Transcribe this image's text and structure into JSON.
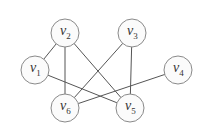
{
  "graph": {
    "nodes": [
      {
        "id": "v1",
        "base": "v",
        "sub": "1",
        "x": 35,
        "y": 70
      },
      {
        "id": "v2",
        "base": "v",
        "sub": "2",
        "x": 65,
        "y": 33
      },
      {
        "id": "v3",
        "base": "v",
        "sub": "3",
        "x": 132,
        "y": 33
      },
      {
        "id": "v4",
        "base": "v",
        "sub": "4",
        "x": 178,
        "y": 70
      },
      {
        "id": "v5",
        "base": "v",
        "sub": "5",
        "x": 130,
        "y": 108
      },
      {
        "id": "v6",
        "base": "v",
        "sub": "6",
        "x": 65,
        "y": 108
      }
    ],
    "edges": [
      [
        "v1",
        "v2"
      ],
      [
        "v2",
        "v6"
      ],
      [
        "v2",
        "v5"
      ],
      [
        "v1",
        "v5"
      ],
      [
        "v3",
        "v6"
      ],
      [
        "v3",
        "v5"
      ],
      [
        "v4",
        "v6"
      ]
    ],
    "node_radius": 14,
    "colors": {
      "edge": "#555555",
      "node_stroke": "#8a8a8a",
      "node_fill": "#fbfbfb",
      "label": "#333333"
    }
  }
}
